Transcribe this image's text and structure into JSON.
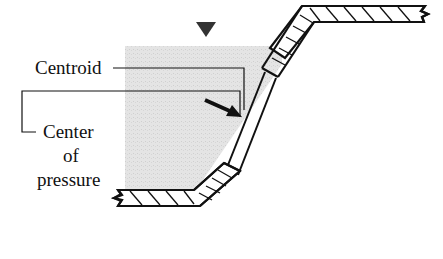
{
  "diagram": {
    "labels": {
      "centroid": "Centroid",
      "center_line1": "Center",
      "center_line2": "of",
      "center_line3": "pressure"
    },
    "icons": {
      "free_surface": "inverted-triangle-marker",
      "force_arrow": "resultant-force-arrow"
    },
    "colors": {
      "water": "#e2e2e2",
      "ink": "#111111",
      "background": "#ffffff"
    }
  }
}
